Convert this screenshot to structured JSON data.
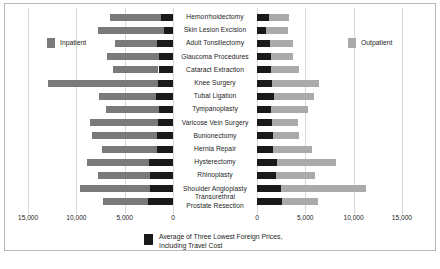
{
  "legend": {
    "inpatient_label": "Inpatient",
    "outpatient_label": "Outpatient",
    "foreign_label_line1": "Average of Three Lowest Foreign Prices,",
    "foreign_label_line2": "Including Travel Cost"
  },
  "colors": {
    "inpatient": "#7a7a7a",
    "outpatient": "#aaaaaa",
    "foreign_average": "#1a1a1a",
    "gridline": "#d9d9d9",
    "frame": "#b9b9b9"
  },
  "axis": {
    "left_ticks": [
      "15,000",
      "10,000",
      "5,000",
      "0"
    ],
    "right_ticks": [
      "0",
      "5,000",
      "10,000",
      "15,000"
    ]
  },
  "chart_data": {
    "type": "bar",
    "orientation": "horizontal",
    "layout": "back-to-back butterfly, two panels sharing centered category labels",
    "title": "",
    "xlabel": "",
    "ylabel": "",
    "xlim_left": [
      15000,
      0
    ],
    "xlim_right": [
      0,
      15000
    ],
    "grid": true,
    "legend_position": "left panel upper-left, right panel upper-right, black series bottom center",
    "categories": [
      "Hemorrhoidectomy",
      "Skin Lesion Excision",
      "Adult Tonsillectomy",
      "Glaucoma Procedures",
      "Cataract Extraction",
      "Knee Surgery",
      "Tubal Ligation",
      "Tympanoplasty",
      "Varicose Vein Surgery",
      "Bunionectomy",
      "Hernia Repair",
      "Hysterectomy",
      "Rhinoplasty",
      "Shoulder Angioplasty",
      "Transurethral Prostate Resection"
    ],
    "series": [
      {
        "name": "Inpatient",
        "panel": "left",
        "color": "#7a7a7a",
        "values": [
          6500,
          7800,
          6000,
          6800,
          6200,
          12900,
          7700,
          6900,
          8600,
          8400,
          7300,
          8900,
          7800,
          9600,
          7200
        ]
      },
      {
        "name": "Average of Three Lowest Foreign Prices, Including Travel Cost",
        "panel": "left",
        "color": "#1a1a1a",
        "values": [
          1200,
          900,
          1700,
          1400,
          1500,
          1600,
          1800,
          1500,
          1600,
          1700,
          1700,
          2500,
          2400,
          2400,
          2600
        ]
      },
      {
        "name": "Outpatient",
        "panel": "right",
        "color": "#aaaaaa",
        "values": [
          3300,
          3200,
          3700,
          3700,
          4300,
          6400,
          5900,
          5300,
          4200,
          4300,
          5700,
          8200,
          6000,
          11300,
          6300
        ]
      },
      {
        "name": "Average of Three Lowest Foreign Prices, Including Travel Cost",
        "panel": "right",
        "color": "#1a1a1a",
        "values": [
          1200,
          900,
          1300,
          1400,
          1500,
          1600,
          1800,
          1500,
          1600,
          1700,
          1700,
          2100,
          2000,
          2450,
          2600
        ]
      }
    ]
  }
}
